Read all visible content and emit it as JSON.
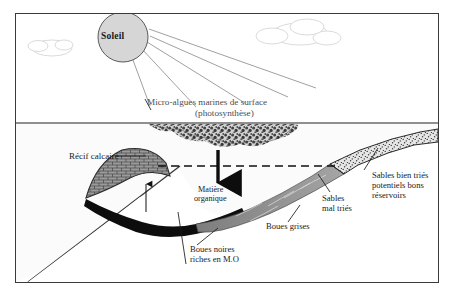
{
  "figure": {
    "kind": "geological-cross-section-diagram",
    "language": "fr",
    "background_color": "#ffffff",
    "frame_color": "#3a3a3a"
  },
  "sky": {
    "sun_label": "Soleil",
    "clouds": [
      {
        "name": "cloud-left"
      },
      {
        "name": "cloud-right"
      }
    ],
    "sun_ray_count": 4
  },
  "labels": {
    "sun": "Soleil",
    "algae_line1": "Micro-algues marines de surface",
    "algae_line2": "(photosynthèse)",
    "reef": "Récif calcaire",
    "organic_matter_line1": "Matière",
    "organic_matter_line2": "organique",
    "sands_poorly_sorted_line1": "Sables",
    "sands_poorly_sorted_line2": "mal triés",
    "sands_well_sorted_line1": "Sables bien triés",
    "sands_well_sorted_line2": "potentiels bons",
    "sands_well_sorted_line3": "réservoirs",
    "grey_muds": "Boues grises",
    "black_muds_line1": "Boues noires",
    "black_muds_line2": "riches en M.O"
  },
  "colors": {
    "sun_fill": "#d6d6d6",
    "sun_stroke": "#5a5a5a",
    "cloud_stroke": "#d2d2d2",
    "ray_stroke": "#8a8a8a",
    "water_surface_line": "#6b6b6b",
    "sea_fill": "#fbfbfb",
    "algae_mass": "#4a4a4a",
    "reef_fill": "#9a9a9a",
    "reef_stroke": "#2b2b2b",
    "sand_fill": "#e2e2e2",
    "sand_stroke": "#2b2b2b",
    "grey_mud_fill": "#8e8e8e",
    "black_mud_fill": "#0d0d0d",
    "basement_stroke": "#3a3a3a",
    "dashed_line": "#101010",
    "text": "#1a1a1a"
  },
  "annotations": {
    "dashed_sea_level_line": true,
    "arrow_down_organic_matter": true,
    "arrow_up_reef_growth": true,
    "leader_lines": 5
  }
}
